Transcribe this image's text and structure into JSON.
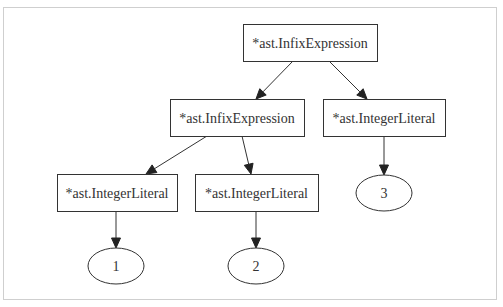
{
  "diagram": {
    "type": "tree",
    "title": "",
    "nodes": [
      {
        "id": "n0",
        "shape": "box",
        "label": "*ast.InfixExpression",
        "x": 243,
        "y": 24,
        "w": 134,
        "h": 37
      },
      {
        "id": "n1",
        "shape": "box",
        "label": "*ast.InfixExpression",
        "x": 170,
        "y": 99,
        "w": 134,
        "h": 37
      },
      {
        "id": "n2",
        "shape": "box",
        "label": "*ast.IntegerLiteral",
        "x": 323,
        "y": 99,
        "w": 122,
        "h": 37
      },
      {
        "id": "n3",
        "shape": "box",
        "label": "*ast.IntegerLiteral",
        "x": 57,
        "y": 174,
        "w": 120,
        "h": 37
      },
      {
        "id": "n4",
        "shape": "box",
        "label": "*ast.IntegerLiteral",
        "x": 195,
        "y": 174,
        "w": 123,
        "h": 37
      },
      {
        "id": "n5",
        "shape": "ellipse",
        "label": "3",
        "cx": 384,
        "cy": 193,
        "rx": 28,
        "ry": 18
      },
      {
        "id": "n6",
        "shape": "ellipse",
        "label": "1",
        "cx": 116,
        "cy": 266,
        "rx": 28,
        "ry": 18
      },
      {
        "id": "n7",
        "shape": "ellipse",
        "label": "2",
        "cx": 256,
        "cy": 266,
        "rx": 28,
        "ry": 18
      }
    ],
    "edges": [
      {
        "from": "n0",
        "to": "n1",
        "x1": 293,
        "y1": 61,
        "x2": 256,
        "y2": 99
      },
      {
        "from": "n0",
        "to": "n2",
        "x1": 329,
        "y1": 61,
        "x2": 367,
        "y2": 99
      },
      {
        "from": "n1",
        "to": "n3",
        "x1": 207,
        "y1": 136,
        "x2": 146,
        "y2": 174
      },
      {
        "from": "n1",
        "to": "n4",
        "x1": 242,
        "y1": 136,
        "x2": 251,
        "y2": 174
      },
      {
        "from": "n2",
        "to": "n5",
        "x1": 384,
        "y1": 136,
        "x2": 384,
        "y2": 175
      },
      {
        "from": "n3",
        "to": "n6",
        "x1": 116,
        "y1": 211,
        "x2": 116,
        "y2": 248
      },
      {
        "from": "n4",
        "to": "n7",
        "x1": 256,
        "y1": 211,
        "x2": 256,
        "y2": 248
      }
    ]
  },
  "colors": {
    "stroke": "#333333",
    "text": "#333333",
    "background": "#ffffff",
    "frame": "#cfcfcf"
  }
}
